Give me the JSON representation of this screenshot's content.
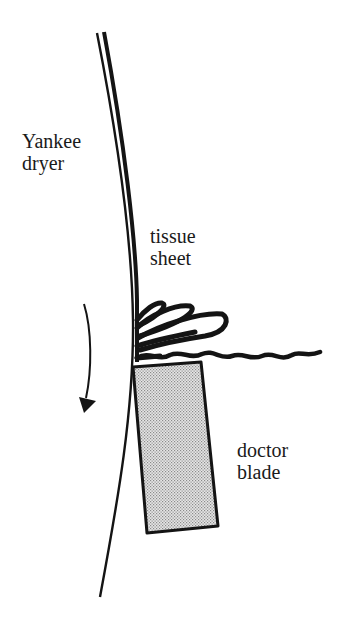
{
  "diagram": {
    "title": "",
    "labels": {
      "dryer_line1": "Yankee",
      "dryer_line2": "dryer",
      "sheet_line1": "tissue",
      "sheet_line2": "sheet",
      "blade_line1": "doctor",
      "blade_line2": "blade"
    },
    "components": [
      {
        "id": "yankee-dryer",
        "description": "Curved surface of the Yankee dryer cylinder"
      },
      {
        "id": "tissue-sheet",
        "description": "Tissue sheet adhered to dryer surface"
      },
      {
        "id": "creped-sheet",
        "description": "Sheet folds/crepes at blade tip, leaves as wavy sheet"
      },
      {
        "id": "doctor-blade",
        "description": "Stippled rectangular blade scraping the sheet off the dryer"
      },
      {
        "id": "rotation-arrow",
        "description": "Downward curved arrow indicating dryer rotation direction"
      }
    ],
    "colors": {
      "ink": "#141414",
      "blade_fill": "#c8c8c8",
      "background": "#ffffff"
    }
  }
}
